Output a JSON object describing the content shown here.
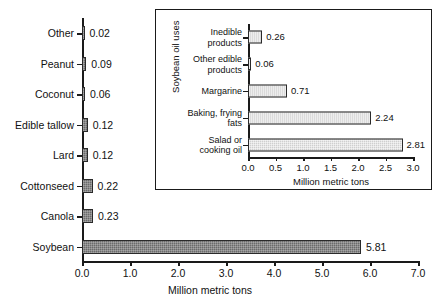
{
  "chart_data": [
    {
      "type": "bar",
      "orientation": "horizontal",
      "name": "main-chart",
      "title": "",
      "xlabel": "Million metric tons",
      "ylabel": "",
      "xlim": [
        0.0,
        7.0
      ],
      "xticks": [
        "0.0",
        "1.0",
        "2.0",
        "3.0",
        "4.0",
        "5.0",
        "6.0",
        "7.0"
      ],
      "xtick_values": [
        0.0,
        1.0,
        2.0,
        3.0,
        4.0,
        5.0,
        6.0,
        7.0
      ],
      "grid": false,
      "legend": "none",
      "bar_color": "#6b6b6b",
      "categories": [
        "Other",
        "Peanut",
        "Coconut",
        "Edible tallow",
        "Lard",
        "Cottonseed",
        "Canola",
        "Soybean"
      ],
      "values": [
        0.02,
        0.09,
        0.06,
        0.12,
        0.12,
        0.22,
        0.23,
        5.81
      ],
      "value_labels": [
        "0.02",
        "0.09",
        "0.06",
        "0.12",
        "0.12",
        "0.22",
        "0.23",
        "5.81"
      ]
    },
    {
      "type": "bar",
      "orientation": "horizontal",
      "name": "inset-chart",
      "title": "",
      "xlabel": "Million metric tons",
      "ylabel": "Soybean oil uses",
      "xlim": [
        0.0,
        3.0
      ],
      "xticks": [
        "0.0",
        "0.5",
        "1.0",
        "1.5",
        "2.0",
        "2.5",
        "3.0"
      ],
      "xtick_values": [
        0.0,
        0.5,
        1.0,
        1.5,
        2.0,
        2.5,
        3.0
      ],
      "grid": false,
      "legend": "none",
      "bar_color": "#cfcfcf",
      "categories": [
        "Inedible products",
        "Other edible products",
        "Margarine",
        "Baking, frying fats",
        "Salad or cooking oil"
      ],
      "category_lines": [
        [
          "Inedible",
          "products"
        ],
        [
          "Other edible",
          "products"
        ],
        [
          "Margarine"
        ],
        [
          "Baking, frying",
          "fats"
        ],
        [
          "Salad or",
          "cooking oil"
        ]
      ],
      "values": [
        0.26,
        0.06,
        0.71,
        2.24,
        2.81
      ],
      "value_labels": [
        "0.26",
        "0.06",
        "0.71",
        "2.24",
        "2.81"
      ]
    }
  ]
}
